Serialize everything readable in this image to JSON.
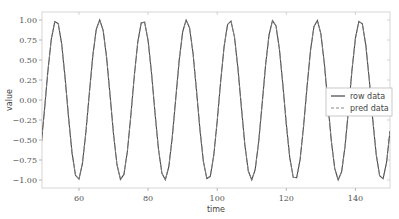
{
  "chart_data": {
    "type": "line",
    "title": "",
    "xlabel": "time",
    "ylabel": "value",
    "xlim": [
      49.3,
      150
    ],
    "ylim": [
      -1.1,
      1.1
    ],
    "xticks": [
      60,
      80,
      100,
      120,
      140
    ],
    "xtick_labels": [
      "60",
      "80",
      "100",
      "120",
      "140"
    ],
    "yticks": [
      1.0,
      0.75,
      0.5,
      0.25,
      0.0,
      -0.25,
      -0.5,
      -0.75,
      -1.0
    ],
    "ytick_labels": [
      "1.00",
      "0.75",
      "0.50",
      "0.25",
      "0.00",
      "−0.25",
      "−0.50",
      "−0.75",
      "−1.00"
    ],
    "grid": false,
    "legend_position": "center right",
    "x_start": 49,
    "x_end": 150,
    "x_step": 1,
    "function": "sin(t/2)",
    "series": [
      {
        "name": "row data",
        "style": "solid",
        "color": "#444444",
        "formula": "sin(t/2)"
      },
      {
        "name": "pred data",
        "style": "dashed",
        "color": "#888888",
        "formula": "sin(t/2)"
      }
    ]
  },
  "legend": {
    "row_label": "row data",
    "pred_label": "pred data"
  },
  "axes": {
    "xlabel": "time",
    "ylabel": "value"
  }
}
